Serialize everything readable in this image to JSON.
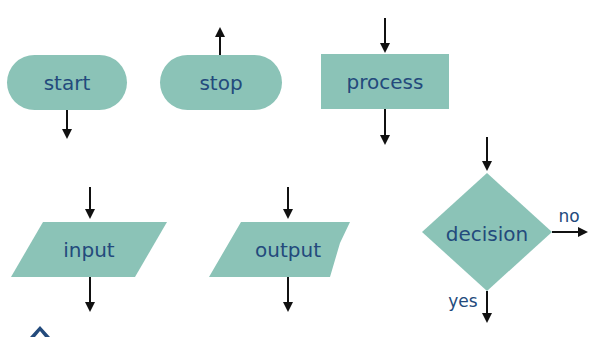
{
  "colors": {
    "shape_fill": "#8bc3b7",
    "label_text": "#234a7c",
    "arrow": "#111111"
  },
  "shapes": {
    "start": {
      "label": "start",
      "kind": "terminator"
    },
    "stop": {
      "label": "stop",
      "kind": "terminator"
    },
    "process": {
      "label": "process",
      "kind": "rectangle"
    },
    "input": {
      "label": "input",
      "kind": "parallelogram"
    },
    "output": {
      "label": "output",
      "kind": "parallelogram"
    },
    "decision": {
      "label": "decision",
      "kind": "diamond"
    }
  },
  "edge_labels": {
    "no": "no",
    "yes": "yes"
  }
}
